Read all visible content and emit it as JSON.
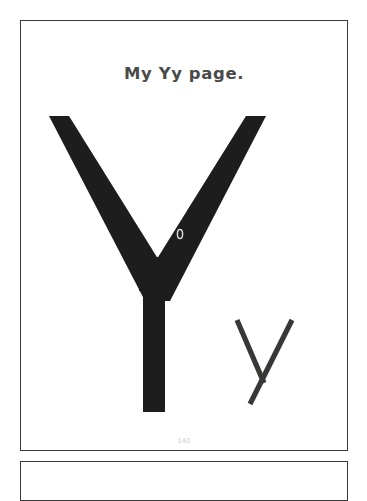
{
  "document": {
    "kind": "handwriting-worksheet-scan",
    "background_color": "#ffffff",
    "page_border_color": "#3a3a3a"
  },
  "worksheet": {
    "title": "My Yy page.",
    "title_color": "#4a4a4a",
    "page_number": "140",
    "page_number_color": "#c9c9c9",
    "letters": {
      "uppercase": {
        "glyph": "Y",
        "color": "#1d1d1d",
        "style": "solid-bold-traceable"
      },
      "lowercase": {
        "glyph": "y",
        "color": "#3a3836",
        "style": "thin-stroke-outline"
      }
    },
    "stray_mark": {
      "label": "0",
      "color": "#d8d8d8"
    }
  },
  "next_page": {
    "visible_edge_label": "next page top edge"
  }
}
